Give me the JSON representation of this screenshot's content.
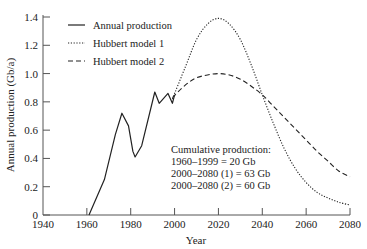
{
  "chart_data": {
    "type": "line",
    "title": "",
    "xlabel": "Year",
    "ylabel": "Annual production (Gb/a)",
    "xlim": [
      1940,
      2080
    ],
    "ylim": [
      0,
      1.4
    ],
    "xticks": [
      1940,
      1960,
      1980,
      2000,
      2020,
      2040,
      2060,
      2080
    ],
    "xtick_labels": [
      "1940",
      "1960",
      "1980",
      "2000",
      "2020",
      "2040",
      "2060",
      "2080"
    ],
    "yticks": [
      0,
      0.2,
      0.4,
      0.6,
      0.8,
      1.0,
      1.2,
      1.4
    ],
    "ytick_labels": [
      "0",
      "0.2",
      "0.4",
      "0.6",
      "0.8",
      "1.0",
      "1.2",
      "1.4"
    ],
    "grid": false,
    "legend_position": "upper left",
    "series": [
      {
        "name": "Annual production",
        "style": "solid",
        "x": [
          1961,
          1968,
          1973,
          1976,
          1979,
          1981,
          1982,
          1985,
          1991,
          1993,
          1997,
          1999,
          2000
        ],
        "y": [
          0,
          0.25,
          0.57,
          0.72,
          0.63,
          0.45,
          0.41,
          0.49,
          0.87,
          0.79,
          0.86,
          0.79,
          0.85
        ]
      },
      {
        "name": "Hubbert model 1",
        "style": "dotted",
        "x": [
          1999,
          2005,
          2010,
          2015,
          2020,
          2025,
          2030,
          2035,
          2040,
          2045,
          2050,
          2055,
          2060,
          2065,
          2070,
          2075,
          2080
        ],
        "y": [
          0.82,
          1.05,
          1.24,
          1.35,
          1.39,
          1.35,
          1.24,
          1.06,
          0.85,
          0.65,
          0.47,
          0.33,
          0.23,
          0.16,
          0.12,
          0.09,
          0.07
        ]
      },
      {
        "name": "Hubbert model 2",
        "style": "dashed",
        "x": [
          1999,
          2005,
          2010,
          2015,
          2020,
          2025,
          2030,
          2035,
          2040,
          2045,
          2050,
          2055,
          2060,
          2065,
          2070,
          2075,
          2080
        ],
        "y": [
          0.83,
          0.92,
          0.97,
          0.99,
          1.0,
          0.99,
          0.96,
          0.91,
          0.85,
          0.77,
          0.69,
          0.61,
          0.53,
          0.45,
          0.38,
          0.31,
          0.27
        ]
      }
    ],
    "annotations": [
      "Cumulative production:",
      "1960–1999 = 20 Gb",
      "2000–2080 (1) = 63 Gb",
      "2000–2080 (2) = 60 Gb"
    ]
  },
  "legend": {
    "items": [
      {
        "label": "Annual production",
        "style": "solid"
      },
      {
        "label": "Hubbert model 1",
        "style": "dotted"
      },
      {
        "label": "Hubbert model 2",
        "style": "dashed"
      }
    ]
  },
  "colors": {
    "line": "#222222",
    "axis": "#555555"
  }
}
